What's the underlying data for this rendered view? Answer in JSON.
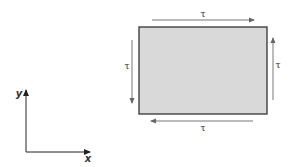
{
  "diagram": {
    "element": {
      "fill": "#d9d9d9",
      "stroke": "#333333"
    },
    "shear_labels": {
      "top": "τ",
      "bottom": "τ",
      "left": "τ",
      "right": "τ"
    },
    "axes": {
      "x": "x",
      "y": "y"
    },
    "arrow_color": "#7a7a7a"
  }
}
